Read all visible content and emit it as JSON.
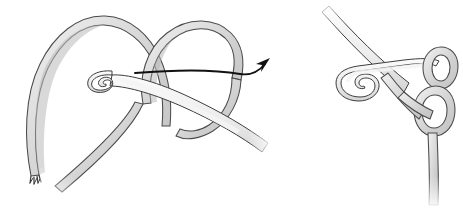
{
  "figure": {
    "background_color": "#ffffff",
    "width": 463,
    "height": 210,
    "panel_count": 2,
    "colors": {
      "yarn_fill": "#d9d9d9",
      "yarn_outline": "#4a4a4a",
      "yarn_shade": "#b9b9b9",
      "hook_fill": "#ececec",
      "hook_outline": "#3d3d3d",
      "arrow": "#111111",
      "background": "#ffffff"
    }
  },
  "panels": [
    {
      "id": "panel-left",
      "label": "Step 1 - wrap yarn around hook",
      "elements": [
        {
          "name": "yarn-left-arch",
          "label": "Left yarn arch"
        },
        {
          "name": "yarn-right-loop",
          "label": "Right yarn loop crossing over"
        },
        {
          "name": "crochet-hook",
          "label": "Crochet hook passing through loop"
        },
        {
          "name": "yarn-tail-frayed",
          "label": "Frayed yarn tail end"
        },
        {
          "name": "yarn-working-end",
          "label": "Working yarn end"
        },
        {
          "name": "motion-arrow",
          "label": "Curved arrow showing yarn pulled through loop to the right"
        }
      ]
    },
    {
      "id": "panel-right",
      "label": "Step 2 - tighten the knot on the hook",
      "elements": [
        {
          "name": "crochet-hook",
          "label": "Crochet hook with yarn caught in hook"
        },
        {
          "name": "knot-loops",
          "label": "Interlocking yarn loops forming the knot"
        },
        {
          "name": "yarn-standing-end",
          "label": "Standing yarn end hanging down"
        }
      ]
    }
  ]
}
